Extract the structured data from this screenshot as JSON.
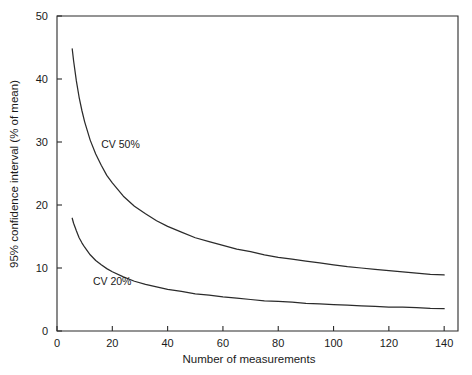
{
  "chart_data": {
    "type": "line",
    "title": "",
    "xlabel": "Number of measurements",
    "ylabel": "95% confidence interval (% of mean)",
    "xlim": [
      0,
      145
    ],
    "ylim": [
      0,
      50
    ],
    "grid": false,
    "legend_position": "inline-annotation",
    "xticks": [
      0,
      20,
      40,
      60,
      80,
      100,
      120,
      140
    ],
    "xticklabels": [
      "0",
      "20",
      "40",
      "60",
      "80",
      "100",
      "120",
      "140"
    ],
    "yticks": [
      0,
      10,
      20,
      30,
      40,
      50
    ],
    "yticklabels": [
      "0",
      "10",
      "20",
      "30",
      "40",
      "50"
    ],
    "annotations": [
      {
        "text": "CV 50%",
        "x": 16,
        "y": 29.0
      },
      {
        "text": "CV 20%",
        "x": 13,
        "y": 7.3
      }
    ],
    "series": [
      {
        "name": "CV 50%",
        "label": "CV 50%",
        "color": "#2b2b2b",
        "x": [
          5.5,
          6,
          7,
          8,
          9,
          10,
          12,
          14,
          16,
          18,
          20,
          24,
          28,
          32,
          36,
          40,
          45,
          50,
          55,
          60,
          65,
          70,
          75,
          80,
          85,
          90,
          95,
          100,
          105,
          110,
          115,
          120,
          125,
          130,
          135,
          140
        ],
        "y": [
          44.8,
          42.9,
          39.7,
          37.1,
          35.0,
          33.2,
          30.3,
          28.1,
          26.3,
          24.7,
          23.5,
          21.4,
          19.8,
          18.6,
          17.5,
          16.6,
          15.7,
          14.8,
          14.2,
          13.6,
          13.0,
          12.6,
          12.1,
          11.7,
          11.4,
          11.1,
          10.8,
          10.5,
          10.2,
          10.0,
          9.8,
          9.6,
          9.4,
          9.2,
          9.0,
          8.9
        ]
      },
      {
        "name": "CV 20%",
        "label": "CV 20%",
        "color": "#2b2b2b",
        "x": [
          5.5,
          6,
          7,
          8,
          9,
          10,
          12,
          14,
          16,
          18,
          20,
          24,
          28,
          32,
          36,
          40,
          45,
          50,
          55,
          60,
          65,
          70,
          75,
          80,
          85,
          90,
          95,
          100,
          105,
          110,
          115,
          120,
          125,
          130,
          135,
          140
        ],
        "y": [
          17.9,
          17.1,
          15.9,
          14.8,
          14.0,
          13.3,
          12.1,
          11.2,
          10.5,
          9.9,
          9.4,
          8.6,
          7.9,
          7.4,
          7.0,
          6.6,
          6.3,
          5.9,
          5.7,
          5.4,
          5.2,
          5.0,
          4.8,
          4.7,
          4.6,
          4.4,
          4.3,
          4.2,
          4.1,
          4.0,
          3.9,
          3.8,
          3.8,
          3.7,
          3.6,
          3.55
        ]
      }
    ]
  }
}
